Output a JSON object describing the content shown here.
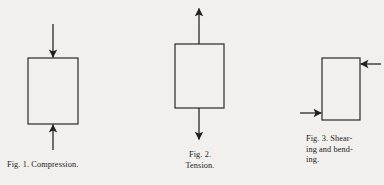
{
  "plate": {
    "background_color": "#f2f0ec",
    "ink_color": "#221f1d",
    "description": "Three engineering line figures showing stress types on rectangular blocks"
  },
  "figures": [
    {
      "id": "fig1",
      "number": "1.",
      "fig_word": "Fig.",
      "title": "Compression.",
      "caption_lines": [
        "Fig. 1. Compression."
      ],
      "box": {
        "x": 28,
        "y": 58,
        "width": 50,
        "height": 66
      },
      "arrows": [
        {
          "name": "top-arrow-down",
          "direction": "down",
          "from_x": 53,
          "from_y": 24,
          "to_x": 53,
          "to_y": 58
        },
        {
          "name": "bottom-arrow-up",
          "direction": "up",
          "from_x": 53,
          "from_y": 150,
          "to_x": 53,
          "to_y": 124
        }
      ]
    },
    {
      "id": "fig2",
      "number": "2.",
      "fig_word": "Fig.",
      "title": "Tension.",
      "caption_lines": [
        "Fig. 2.",
        "Tension."
      ],
      "box": {
        "x": 175,
        "y": 44,
        "width": 49,
        "height": 64
      },
      "arrows": [
        {
          "name": "top-arrow-up",
          "direction": "up",
          "from_x": 199,
          "from_y": 44,
          "to_x": 199,
          "to_y": 8
        },
        {
          "name": "bottom-arrow-down",
          "direction": "down",
          "from_x": 199,
          "from_y": 108,
          "to_x": 199,
          "to_y": 140
        }
      ]
    },
    {
      "id": "fig3",
      "number": "3.",
      "fig_word": "Fig.",
      "title": "Shearing and bending.",
      "caption_lines": [
        "Fig. 3. Shear-",
        "ing and bend-",
        "ing."
      ],
      "box": {
        "x": 322,
        "y": 58,
        "width": 38,
        "height": 62
      },
      "arrows": [
        {
          "name": "top-right-arrow-left",
          "direction": "left",
          "from_x": 381,
          "from_y": 64,
          "to_x": 360,
          "to_y": 64
        },
        {
          "name": "bottom-left-arrow-right",
          "direction": "right",
          "from_x": 300,
          "from_y": 113,
          "to_x": 322,
          "to_y": 113
        }
      ]
    }
  ]
}
